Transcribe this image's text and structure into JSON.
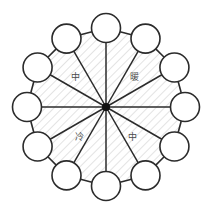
{
  "diagram": {
    "type": "radial-wheel",
    "geometry": {
      "center_x": 106,
      "center_y": 107,
      "ring_radius": 79,
      "node_radius": 14.5,
      "spoke_count": 12,
      "node_count": 12,
      "start_angle_deg": -90,
      "angle_step_deg": 30
    },
    "colors": {
      "stroke": "#2b2b2b",
      "node_fill": "#ffffff",
      "hub": "#111111",
      "hatch": "#d9d9d9",
      "background": "#ffffff",
      "label_text": "#4a4a4a"
    },
    "hub": {
      "name": "center-hub",
      "radius": 4
    },
    "nodes": [
      {
        "id": "node-1",
        "angle_deg": -90,
        "label": ""
      },
      {
        "id": "node-2",
        "angle_deg": -60,
        "label": ""
      },
      {
        "id": "node-3",
        "angle_deg": -30,
        "label": ""
      },
      {
        "id": "node-4",
        "angle_deg": 0,
        "label": ""
      },
      {
        "id": "node-5",
        "angle_deg": 30,
        "label": ""
      },
      {
        "id": "node-6",
        "angle_deg": 60,
        "label": ""
      },
      {
        "id": "node-7",
        "angle_deg": 90,
        "label": ""
      },
      {
        "id": "node-8",
        "angle_deg": 120,
        "label": ""
      },
      {
        "id": "node-9",
        "angle_deg": 150,
        "label": ""
      },
      {
        "id": "node-10",
        "angle_deg": 180,
        "label": ""
      },
      {
        "id": "node-11",
        "angle_deg": 210,
        "label": ""
      },
      {
        "id": "node-12",
        "angle_deg": 240,
        "label": ""
      }
    ],
    "quadrant_labels": [
      {
        "id": "label-upper-left",
        "text": "中",
        "x": 75,
        "y": 77
      },
      {
        "id": "label-upper-right",
        "text": "暖",
        "x": 134,
        "y": 77
      },
      {
        "id": "label-lower-left",
        "text": "冷",
        "x": 79,
        "y": 137
      },
      {
        "id": "label-lower-right",
        "text": "中",
        "x": 132,
        "y": 137
      }
    ]
  }
}
